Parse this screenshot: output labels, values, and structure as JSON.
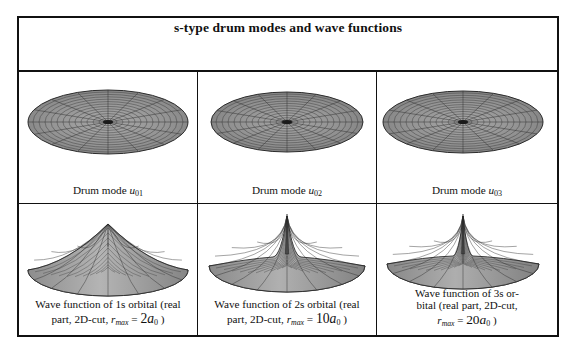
{
  "table": {
    "title": "s-type drum modes and wave functions",
    "rows": [
      {
        "row_name": "drum-modes",
        "cells": [
          {
            "caption_plain": "Drum mode u01",
            "caption_prefix": "Drum mode ",
            "symbol": "u",
            "sub": "01",
            "plot": "flat-disk-mesh"
          },
          {
            "caption_plain": "Drum mode u02",
            "caption_prefix": "Drum mode ",
            "symbol": "u",
            "sub": "02",
            "plot": "flat-disk-mesh"
          },
          {
            "caption_plain": "Drum mode u03",
            "caption_prefix": "Drum mode ",
            "symbol": "u",
            "sub": "03",
            "plot": "flat-disk-mesh"
          }
        ]
      },
      {
        "row_name": "wave-functions",
        "cells": [
          {
            "caption_plain": "Wave function of 1s orbital (real part, 2D-cut, r_max = 2a0 )",
            "line1": "Wave function of 1s orbital (real",
            "line2_prefix": "part, 2D-cut, ",
            "var": "r",
            "var_sub": "max",
            "equals": " = ",
            "value": "2",
            "unit": "a",
            "unit_sub": "0",
            "close": " )",
            "plot": "cone-peak-broad"
          },
          {
            "caption_plain": "Wave function of 2s orbital (real part, 2D-cut, r_max = 10a0 )",
            "line1": "Wave function of 2s orbital (real",
            "line2_prefix": "part, 2D-cut, ",
            "var": "r",
            "var_sub": "max",
            "equals": " = ",
            "value": "10",
            "unit": "a",
            "unit_sub": "0",
            "close": " )",
            "plot": "spike-peak-medium"
          },
          {
            "caption_plain": "Wave function of 3s orbital (real part, 2D-cut, r_max = 20a0 )",
            "line1": "Wave function of 3s or-",
            "line2": "bital (real part, 2D-cut,",
            "var": "r",
            "var_sub": "max",
            "equals": " = ",
            "value": "20",
            "unit": "a",
            "unit_sub": "0",
            "close": " )",
            "plot": "spike-peak-narrow"
          }
        ]
      }
    ]
  },
  "style": {
    "border_color": "#111111",
    "mesh_color": "#2b2b2b",
    "surface_fill": "#8c8c8c",
    "background": "#ffffff"
  }
}
